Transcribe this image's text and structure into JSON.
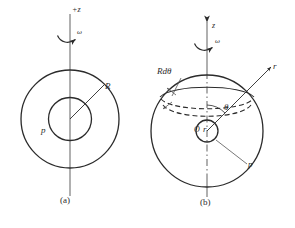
{
  "figure": {
    "background_color": "#ffffff",
    "stroke_color": "#2b2b2b",
    "width": 295,
    "height": 228
  },
  "panels": [
    {
      "id": "a",
      "caption": "(a)",
      "labels": {
        "axis": "+z",
        "omega": "ω",
        "radius": "R",
        "point": "p"
      }
    },
    {
      "id": "b",
      "caption": "(b)",
      "labels": {
        "axis": "z",
        "omega": "ω",
        "band": "Rdθ",
        "theta": "θ",
        "origin": "O",
        "radial": "r",
        "point": "p"
      }
    }
  ],
  "footer": {
    "text": ""
  }
}
